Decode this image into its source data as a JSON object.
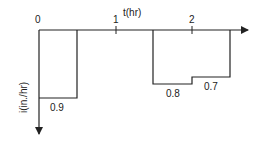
{
  "diagram": {
    "type": "hyetograph",
    "x_axis": {
      "label": "t(hr)",
      "ticks": [
        {
          "value": 0,
          "label": "0"
        },
        {
          "value": 1,
          "label": "1"
        },
        {
          "value": 2,
          "label": "2"
        }
      ],
      "direction": "right"
    },
    "y_axis": {
      "label": "i(in./hr)",
      "direction": "down"
    },
    "blocks": [
      {
        "t_start": 0.0,
        "t_end": 0.5,
        "intensity": 0.9,
        "label": "0.9"
      },
      {
        "t_start": 1.5,
        "t_end": 2.0,
        "intensity": 0.8,
        "label": "0.8"
      },
      {
        "t_start": 2.0,
        "t_end": 2.5,
        "intensity": 0.7,
        "label": "0.7"
      }
    ],
    "colors": {
      "line": "#222222",
      "background": "#ffffff"
    }
  }
}
